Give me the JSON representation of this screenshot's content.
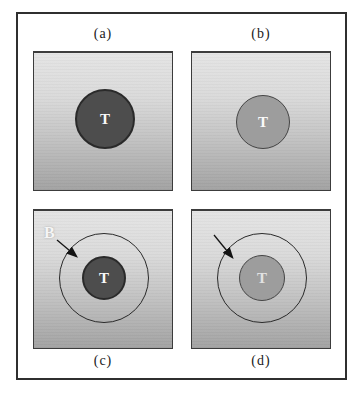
{
  "figure": {
    "panels": [
      {
        "caption": "(a)",
        "tumor_label": "T",
        "tumor_style": "dark",
        "has_boundary_ring": false,
        "has_arrow": false
      },
      {
        "caption": "(b)",
        "tumor_label": "T",
        "tumor_style": "light",
        "has_boundary_ring": false,
        "has_arrow": false
      },
      {
        "caption": "(c)",
        "tumor_label": "T",
        "boundary_label": "B",
        "tumor_style": "dark",
        "has_boundary_ring": true,
        "has_arrow": true
      },
      {
        "caption": "(d)",
        "tumor_label": "T",
        "tumor_style": "light",
        "has_boundary_ring": true,
        "has_arrow": true
      }
    ],
    "colors": {
      "page_background": "#ffffff",
      "frame_border": "#2f2f2f",
      "panel_border": "#3c3c3c",
      "panel_gradient_top": "#e4e4e4",
      "panel_gradient_bottom": "#a2a2a2",
      "dark_tumor_fill": "#4d4d4d",
      "light_tumor_fill": "#9d9d9d",
      "ring_outline": "#2a2a2a",
      "caption_text": "#1a1a1a",
      "tumor_text": "#fafafa",
      "boundary_text": "#f5f5f5",
      "arrow": "#141414"
    }
  }
}
